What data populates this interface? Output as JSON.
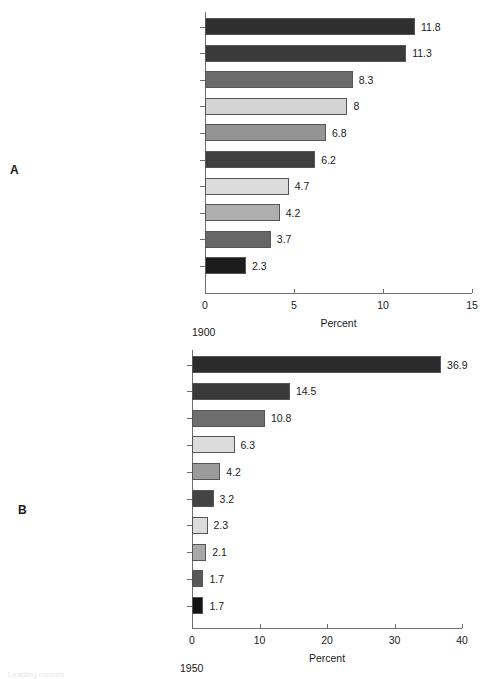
{
  "figure": {
    "panel_a_letter": "A",
    "panel_b_letter": "B",
    "cut_off_footer": "Leading causes"
  },
  "chart_data": [
    {
      "type": "bar",
      "orientation": "horizontal",
      "panel": "A",
      "title": "",
      "caption": "1900",
      "xlabel": "Percent",
      "ylabel": "",
      "xlim": [
        0,
        15
      ],
      "xticks": [
        0,
        5,
        10,
        15
      ],
      "xtick_labels": [
        "0",
        "5",
        "10",
        "15"
      ],
      "grid": false,
      "legend": "none",
      "categories": [
        "Pneumonia and influenza",
        "Tuberculosis",
        "Gastritis, enteritis, colitis",
        "Heart diseases",
        "Symptoms, senility, ill-defined",
        "Vascular lesions affecting CNS",
        "Chronic nephritis and renal sclerosis",
        "Unintentional injuries",
        "Malignant neoplasms",
        "Diphtheria"
      ],
      "values": [
        11.8,
        11.3,
        8.3,
        8,
        6.8,
        6.2,
        4.7,
        4.2,
        3.7,
        2.3
      ],
      "value_labels": [
        "11.8",
        "11.3",
        "8.3",
        "8",
        "6.8",
        "6.2",
        "4.7",
        "4.2",
        "3.7",
        "2.3"
      ],
      "bar_colors": [
        "#2f2f2f",
        "#3a3a3a",
        "#6b6b6b",
        "#d4d4d4",
        "#949494",
        "#3f3f3f",
        "#dcdcdc",
        "#aeaeae",
        "#666666",
        "#1c1c1c"
      ]
    },
    {
      "type": "bar",
      "orientation": "horizontal",
      "panel": "B",
      "title": "",
      "caption": "1950",
      "xlabel": "Percent",
      "ylabel": "",
      "xlim": [
        0,
        40
      ],
      "xticks": [
        0,
        10,
        20,
        30,
        40
      ],
      "xtick_labels": [
        "0",
        "10",
        "20",
        "30",
        "40"
      ],
      "grid": false,
      "legend": "none",
      "categories": [
        "Disease of the heart",
        "Malignant neoplasms",
        "CNS vascular lesions",
        "Accidents",
        "Certain diseases of early infancy",
        "Influenza and pneumonia",
        "Tuberculosis",
        "General ateriosclerosis",
        "Nephritis and renal sclerosis",
        "Diabetes mellitus"
      ],
      "values": [
        36.9,
        14.5,
        10.8,
        6.3,
        4.2,
        3.2,
        2.3,
        2.1,
        1.7,
        1.7
      ],
      "value_labels": [
        "36.9",
        "14.5",
        "10.8",
        "6.3",
        "4.2",
        "3.2",
        "2.3",
        "2.1",
        "1.7",
        "1.7"
      ],
      "bar_colors": [
        "#2b2b2b",
        "#3a3a3a",
        "#6e6e6e",
        "#dcdcdc",
        "#9b9b9b",
        "#444444",
        "#dcdcdc",
        "#a8a8a8",
        "#595959",
        "#141414"
      ]
    }
  ]
}
